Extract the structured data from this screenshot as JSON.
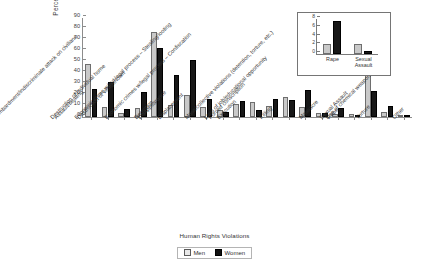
{
  "chart_data": {
    "type": "bar",
    "title": "",
    "xlabel": "Human Rights Violations",
    "ylabel": "Percentage",
    "ylim": [
      0,
      90
    ],
    "yticks": [
      0,
      10,
      20,
      30,
      40,
      50,
      60,
      70,
      80,
      90
    ],
    "grid": false,
    "legend_position": "bottom",
    "legend_title": "Human Rights Violations",
    "categories": [
      "Assault/beating",
      "Bombardment/indiscriminate attack on civilians",
      "Destruction of individual home",
      "Destruction of village/town",
      "Detention",
      "Disappearance",
      "Displacement",
      "Economic crime w/out legal process – Stealing/looting",
      "Economic crimes w/legal process – Confiscation",
      "Execution",
      "Forced conscription",
      "Killing",
      "Loss of job/educational opportunity",
      "Mass/collective violations (detention, torture, etc.)",
      "Massacre",
      "Rape",
      "Sexual Assault",
      "Torture",
      "Use of chemical weapons",
      "Other"
    ],
    "series": [
      {
        "name": "Men",
        "color": "#c9c9c9",
        "values": [
          48,
          9,
          3.5,
          8,
          77,
          11,
          20,
          9,
          6,
          11.5,
          14,
          10,
          18.5,
          9.5,
          4,
          2.5,
          3,
          53.5,
          4.5,
          0.5
        ]
      },
      {
        "name": "Women",
        "color": "#171717",
        "values": [
          25.5,
          31.5,
          7,
          23,
          62.5,
          38.5,
          51.5,
          16,
          4.5,
          14.5,
          6,
          16,
          15.5,
          25,
          4,
          8,
          1.5,
          24,
          10,
          2
        ]
      }
    ],
    "inset": {
      "type": "bar",
      "ylim": [
        0,
        8
      ],
      "yticks": [
        0,
        2,
        4,
        6,
        8
      ],
      "categories": [
        "Rape",
        "Sexual Assault"
      ],
      "series": [
        {
          "name": "Men",
          "color": "#c9c9c9",
          "values": [
            2.2,
            2.2
          ]
        },
        {
          "name": "Women",
          "color": "#171717",
          "values": [
            7.5,
            0.7
          ]
        }
      ]
    }
  },
  "legend": {
    "title": "Human Rights Violations",
    "items": [
      {
        "label": "Men",
        "marker": "light-gray-square"
      },
      {
        "label": "Women",
        "marker": "black-square"
      }
    ]
  }
}
